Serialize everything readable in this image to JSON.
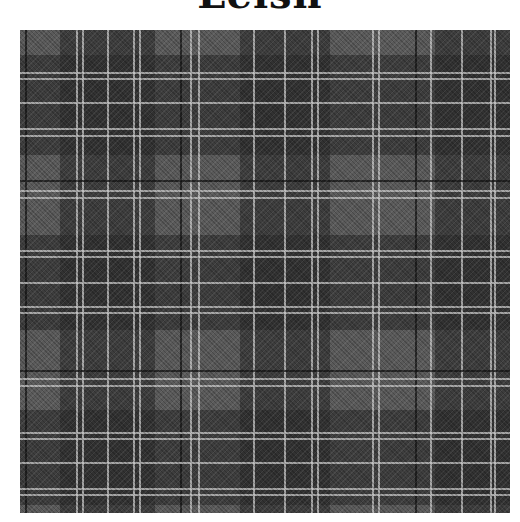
{
  "title": "Leish",
  "swatch": {
    "colors": {
      "ground": "#5a5a5a",
      "dark_block": "#2a2a2a",
      "white_line": "#c8c8c8",
      "black_line": "#141414"
    },
    "vertical_dark_blocks": [
      [
        40,
        135
      ],
      [
        220,
        310
      ],
      [
        415,
        490
      ]
    ],
    "vertical_white_lines": [
      56,
      62,
      87,
      113,
      119,
      170,
      178,
      233,
      264,
      291,
      297,
      352,
      358,
      410,
      441,
      470,
      474
    ],
    "vertical_black_lines": [
      5,
      160,
      395
    ],
    "horizontal_dark_blocks": [
      [
        25,
        125
      ],
      [
        205,
        300
      ],
      [
        380,
        475
      ]
    ],
    "horizontal_white_lines": [
      42,
      48,
      72,
      98,
      105,
      160,
      167,
      220,
      226,
      252,
      276,
      282,
      348,
      355,
      402,
      408,
      432,
      458,
      464
    ],
    "horizontal_black_lines": [
      150,
      340
    ]
  }
}
